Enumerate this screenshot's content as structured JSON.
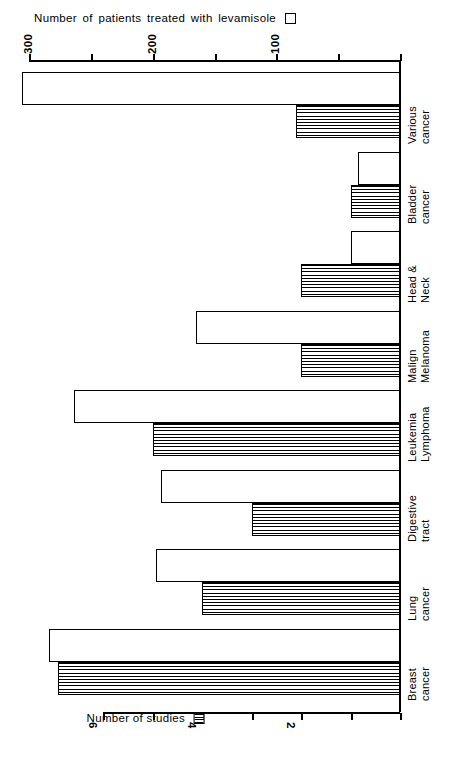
{
  "chart_data": {
    "type": "bar",
    "orientation": "horizontal",
    "title": "",
    "categories": [
      "Breast cancer",
      "Lung cancer",
      "Digestive tract",
      "Leukemia Lymphoma",
      "Malign Melanoma",
      "Head & Neck",
      "Bladder cancer",
      "Various cancer"
    ],
    "category_lines": [
      [
        "Breast",
        "cancer"
      ],
      [
        "Lung",
        "cancer"
      ],
      [
        "Digestive",
        "tract"
      ],
      [
        "Leukemia",
        "Lymphoma"
      ],
      [
        "Malign",
        "Melanoma"
      ],
      [
        "Head &",
        "Neck"
      ],
      [
        "Bladder",
        "cancer"
      ],
      [
        "Various",
        "cancer"
      ]
    ],
    "series": [
      {
        "name": "Number of patients treated with levamisole",
        "fill": "white",
        "axis": "patients",
        "values": [
          284,
          197,
          193,
          264,
          165,
          40,
          34,
          306
        ]
      },
      {
        "name": "Number of studies",
        "fill": "hatched",
        "axis": "studies",
        "values": [
          6.9,
          4.0,
          3.0,
          5.0,
          2.0,
          2.0,
          1.0,
          2.1
        ]
      }
    ],
    "axes": {
      "patients": {
        "label": "Number of patients treated with levamisole",
        "ticks": [
          0,
          50,
          100,
          150,
          200,
          250,
          300
        ],
        "tick_labels": [
          "",
          "",
          "100",
          "",
          "200",
          "",
          "300"
        ],
        "range": [
          0,
          300
        ],
        "position": "top",
        "direction": "right-to-left"
      },
      "studies": {
        "label": "Number of studies",
        "ticks": [
          0,
          1,
          2,
          3,
          4,
          5,
          6
        ],
        "tick_labels": [
          "",
          "",
          "2",
          "",
          "4",
          "",
          "6"
        ],
        "range": [
          0,
          6
        ],
        "position": "bottom",
        "direction": "right-to-left"
      }
    },
    "grid": false,
    "legend_position": "top-left and bottom-center"
  },
  "top_legend": {
    "text": "Number of patients treated with levamisole",
    "swatch": "open-square"
  },
  "bottom_legend": {
    "text": "Number of studies",
    "swatch": "hatched-square"
  },
  "patients_ticks": [
    {
      "label": "300",
      "value": 300
    },
    {
      "label": "",
      "value": 250
    },
    {
      "label": "200",
      "value": 200
    },
    {
      "label": "",
      "value": 150
    },
    {
      "label": "100",
      "value": 100
    },
    {
      "label": "",
      "value": 50
    },
    {
      "label": "",
      "value": 0
    }
  ],
  "studies_ticks": [
    {
      "label": "6",
      "value": 6
    },
    {
      "label": "",
      "value": 5
    },
    {
      "label": "4",
      "value": 4
    },
    {
      "label": "",
      "value": 3
    },
    {
      "label": "2",
      "value": 2
    },
    {
      "label": "",
      "value": 1
    },
    {
      "label": "",
      "value": 0
    }
  ],
  "colors": {
    "ink": "#000000",
    "paper": "#ffffff"
  }
}
